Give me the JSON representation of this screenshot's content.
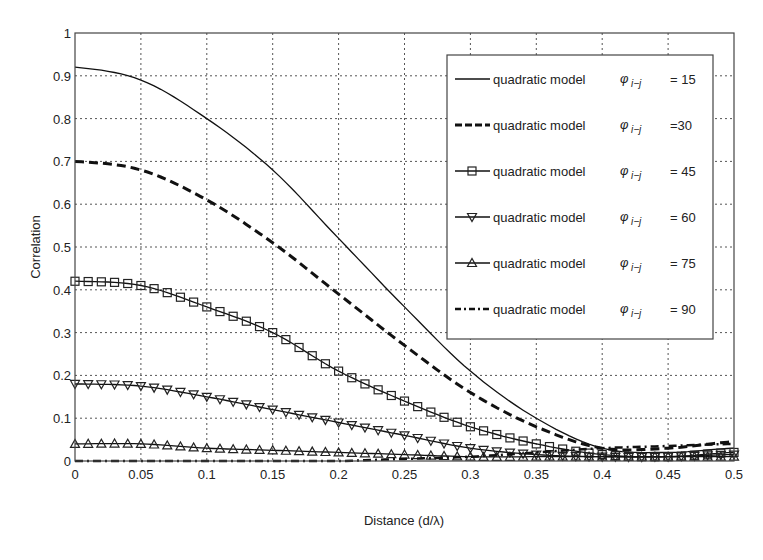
{
  "chart_data": {
    "type": "line",
    "title": "",
    "xlabel": "Distance   (d/λ)",
    "ylabel": "Correlation",
    "xlim": [
      0,
      0.5
    ],
    "ylim": [
      0,
      1
    ],
    "grid": true,
    "legend_position": "upper right",
    "x_ticks": [
      "0",
      "0.05",
      "0.1",
      "0.15",
      "0.2",
      "0.25",
      "0.3",
      "0.35",
      "0.4",
      "0.45",
      "0.5"
    ],
    "y_ticks": [
      "0",
      "0.1",
      "0.2",
      "0.3",
      "0.4",
      "0.5",
      "0.6",
      "0.7",
      "0.8",
      "0.9",
      "1"
    ],
    "x": [
      0,
      0.05,
      0.1,
      0.15,
      0.2,
      0.25,
      0.3,
      0.35,
      0.4,
      0.45,
      0.5
    ],
    "series": [
      {
        "name": "quadratic model φ i-j = 15",
        "label_left": "quadratic model",
        "label_right": "= 15",
        "style": "solid",
        "marker": "none",
        "values": [
          0.92,
          0.89,
          0.8,
          0.68,
          0.52,
          0.36,
          0.21,
          0.1,
          0.03,
          0.02,
          0.03
        ]
      },
      {
        "name": "quadratic model φ i-j =30",
        "label_left": "quadratic model",
        "label_right": "=30",
        "style": "dashed",
        "marker": "none",
        "values": [
          0.7,
          0.68,
          0.61,
          0.51,
          0.39,
          0.27,
          0.16,
          0.08,
          0.03,
          0.03,
          0.045
        ]
      },
      {
        "name": "quadratic model φ i-j = 45",
        "label_left": "quadratic model",
        "label_right": "= 45",
        "style": "solid",
        "marker": "square",
        "values": [
          0.42,
          0.41,
          0.36,
          0.3,
          0.21,
          0.14,
          0.08,
          0.04,
          0.015,
          0.01,
          0.02
        ]
      },
      {
        "name": "quadratic model φ i-j = 60",
        "label_left": "quadratic model",
        "label_right": "= 60",
        "style": "solid",
        "marker": "triangle-down",
        "values": [
          0.18,
          0.175,
          0.15,
          0.12,
          0.09,
          0.06,
          0.03,
          0.015,
          0.01,
          0.01,
          0.015
        ]
      },
      {
        "name": "quadratic model φ i-j = 75",
        "label_left": "quadratic model",
        "label_right": "= 75",
        "style": "solid",
        "marker": "triangle-up",
        "values": [
          0.04,
          0.04,
          0.03,
          0.025,
          0.02,
          0.015,
          0.01,
          0.01,
          0.01,
          0.01,
          0.01
        ]
      },
      {
        "name": "quadratic model φ i-j = 90",
        "label_left": "quadratic model",
        "label_right": "= 90",
        "style": "dashdot",
        "marker": "none",
        "values": [
          0.0,
          0.0,
          0.0,
          0.0,
          0.0,
          0.005,
          0.01,
          0.02,
          0.03,
          0.035,
          0.04
        ]
      }
    ],
    "legend_symbol": "φ",
    "legend_subscript": "i−j"
  }
}
